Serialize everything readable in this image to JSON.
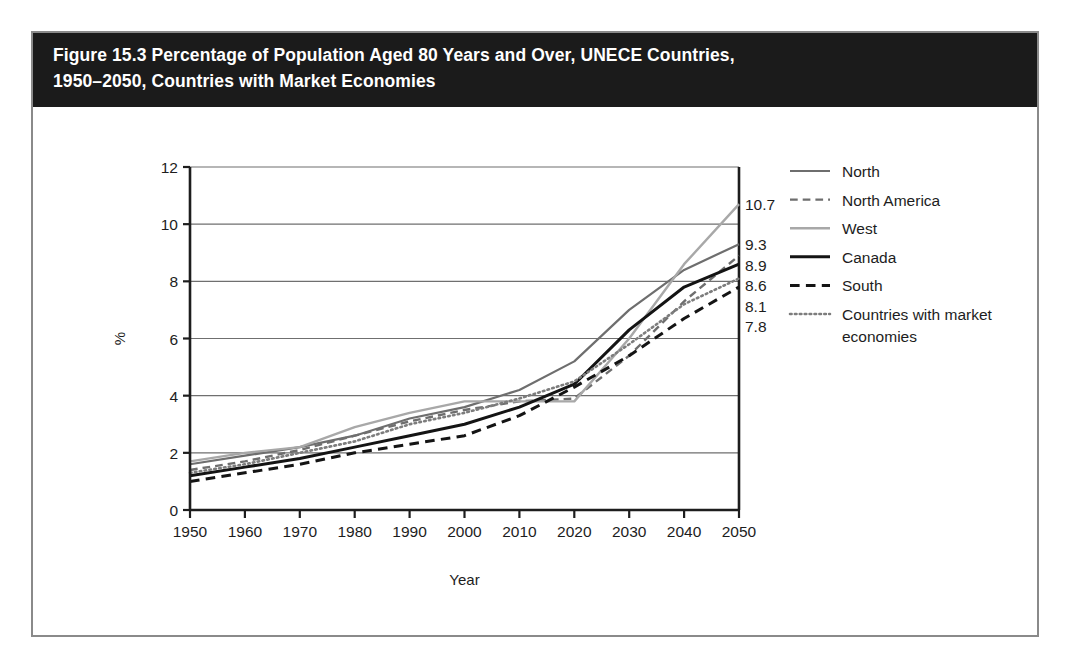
{
  "figure": {
    "title_line1": "Figure 15.3 Percentage of Population Aged 80 Years and Over, UNECE Countries,",
    "title_line2": "1950–2050, Countries with Market Economies"
  },
  "chart_data": {
    "type": "line",
    "title": "Figure 15.3 Percentage of Population Aged 80 Years and Over, UNECE Countries, 1950–2050, Countries with Market Economies",
    "xlabel": "Year",
    "ylabel": "%",
    "x": [
      1950,
      1960,
      1970,
      1980,
      1990,
      2000,
      2010,
      2020,
      2030,
      2040,
      2050
    ],
    "xtick_labels": [
      "1950",
      "1960",
      "1970",
      "1980",
      "1990",
      "2000",
      "2010",
      "2020",
      "2030",
      "2040",
      "2050"
    ],
    "ytick_labels": [
      "0",
      "2",
      "4",
      "6",
      "8",
      "10",
      "12"
    ],
    "yticks": [
      0,
      2,
      4,
      6,
      8,
      10,
      12
    ],
    "xlim": [
      1950,
      2050
    ],
    "ylim": [
      0,
      12
    ],
    "grid": "horizontal",
    "legend_position": "right",
    "series": [
      {
        "name": "North",
        "style": "solid",
        "color": "#6e6e6e",
        "width": 2.2,
        "values": [
          1.6,
          1.9,
          2.2,
          2.6,
          3.2,
          3.6,
          4.2,
          5.2,
          7.0,
          8.4,
          9.3
        ],
        "end_label": "9.3"
      },
      {
        "name": "North America",
        "style": "dashed",
        "color": "#6e6e6e",
        "width": 2.4,
        "values": [
          1.4,
          1.7,
          2.1,
          2.6,
          3.1,
          3.5,
          3.8,
          3.9,
          5.4,
          7.3,
          8.9
        ],
        "end_label": "8.9"
      },
      {
        "name": "West",
        "style": "solid",
        "color": "#a8a8a8",
        "width": 2.4,
        "values": [
          1.7,
          2.0,
          2.2,
          2.9,
          3.4,
          3.8,
          3.8,
          3.8,
          6.0,
          8.6,
          10.7
        ],
        "end_label": "10.7"
      },
      {
        "name": "Canada",
        "style": "solid",
        "color": "#141414",
        "width": 3.0,
        "values": [
          1.2,
          1.5,
          1.8,
          2.2,
          2.6,
          3.0,
          3.6,
          4.4,
          6.3,
          7.8,
          8.6
        ],
        "end_label": "8.6"
      },
      {
        "name": "South",
        "style": "dashed",
        "color": "#141414",
        "width": 3.0,
        "values": [
          1.0,
          1.3,
          1.6,
          2.0,
          2.3,
          2.6,
          3.3,
          4.3,
          5.4,
          6.7,
          7.8
        ],
        "end_label": "7.8"
      },
      {
        "name": "Countries with market economies",
        "style": "dotted",
        "color": "#7d7d7d",
        "width": 2.6,
        "values": [
          1.3,
          1.6,
          2.0,
          2.4,
          3.0,
          3.4,
          3.9,
          4.5,
          5.8,
          7.2,
          8.1
        ],
        "end_label": "8.1"
      }
    ],
    "end_labels": [
      "10.7",
      "9.3",
      "8.9",
      "8.6",
      "8.1",
      "7.8"
    ]
  },
  "legend": {
    "items": [
      {
        "label": "North"
      },
      {
        "label": "North America"
      },
      {
        "label": "West"
      },
      {
        "label": "Canada"
      },
      {
        "label": "South"
      },
      {
        "label": "Countries with market"
      },
      {
        "label": "economies"
      }
    ]
  }
}
